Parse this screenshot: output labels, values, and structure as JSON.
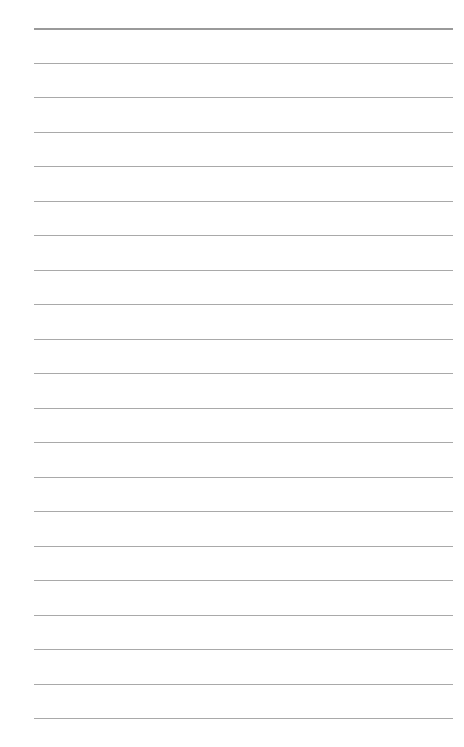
{
  "page": {
    "type": "lined-paper",
    "background": "#ffffff",
    "line_color": "#a9a9a9",
    "line_count": 21,
    "first_line_y": 28,
    "line_spacing": 34.5,
    "line_left": 34,
    "line_right": 453,
    "text": []
  }
}
